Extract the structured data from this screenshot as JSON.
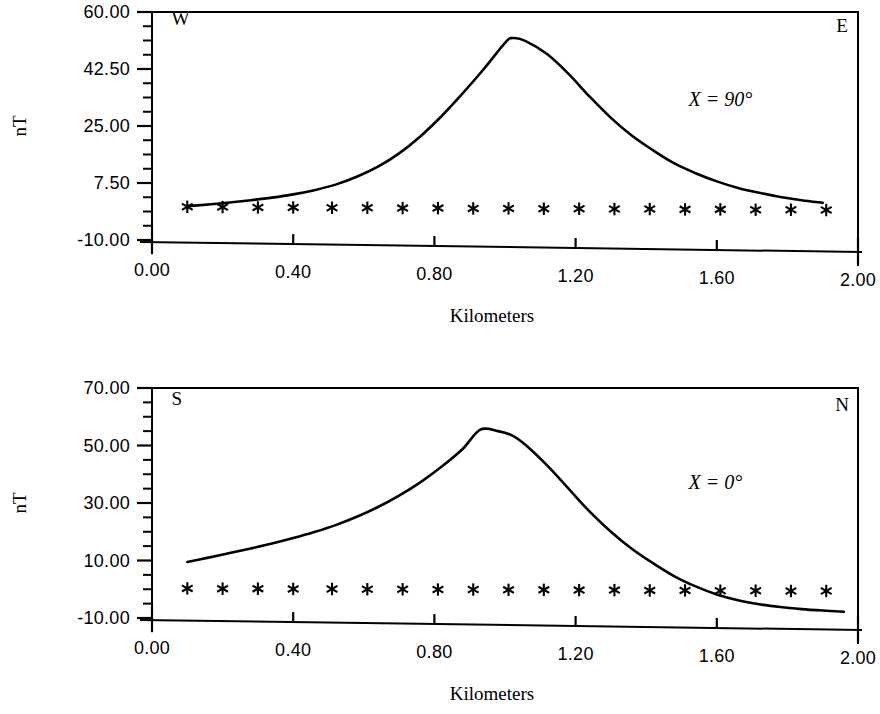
{
  "figure": {
    "background": "#ffffff",
    "ink_color": "#000000"
  },
  "charts": [
    {
      "id": "chart-top",
      "ylabel": "nT",
      "xlabel": "Kilometers",
      "corner_left": "W",
      "corner_right": "E",
      "annotation": "X = 90°",
      "ytick_labels": [
        "60.00",
        "42.50",
        "25.00",
        "7.50",
        "-10.00"
      ],
      "xtick_labels": [
        "0.00",
        "0.40",
        "0.80",
        "1.20",
        "1.60",
        "2.00"
      ]
    },
    {
      "id": "chart-bottom",
      "ylabel": "nT",
      "xlabel": "Kilometers",
      "corner_left": "S",
      "corner_right": "N",
      "annotation": "X = 0°",
      "ytick_labels": [
        "70.00",
        "50.00",
        "30.00",
        "10.00",
        "-10.00"
      ],
      "xtick_labels": [
        "0.00",
        "0.40",
        "0.80",
        "1.20",
        "1.60",
        "2.00"
      ]
    }
  ],
  "chart_data": [
    {
      "type": "line",
      "id": "chart-top",
      "title": "",
      "xlabel": "Kilometers",
      "ylabel": "nT",
      "xlim": [
        0.0,
        2.0
      ],
      "ylim": [
        -10.0,
        60.0
      ],
      "xticks": [
        0.0,
        0.4,
        0.8,
        1.2,
        1.6,
        2.0
      ],
      "yticks": [
        -10.0,
        7.5,
        25.0,
        42.5,
        60.0
      ],
      "minor_ticks_per_interval": 3,
      "grid": false,
      "legend": null,
      "annotations": [
        {
          "text": "W",
          "x": 0.06,
          "y": 56.0
        },
        {
          "text": "E",
          "x": 1.94,
          "y": 54.0
        },
        {
          "text": "X = 90°",
          "x": 1.56,
          "y": 31.0
        }
      ],
      "series": [
        {
          "name": "magnetic anomaly profile",
          "style": "solid-line",
          "x": [
            0.1,
            0.16,
            0.22,
            0.28,
            0.34,
            0.4,
            0.46,
            0.52,
            0.58,
            0.64,
            0.7,
            0.76,
            0.82,
            0.88,
            0.94,
            1.0,
            1.02,
            1.06,
            1.12,
            1.18,
            1.24,
            1.3,
            1.36,
            1.42,
            1.48,
            1.54,
            1.6,
            1.66,
            1.72,
            1.78,
            1.84,
            1.9
          ],
          "y": [
            0.4,
            0.9,
            1.5,
            2.2,
            3.0,
            4.0,
            5.3,
            7.0,
            9.4,
            12.5,
            16.6,
            21.8,
            28.0,
            35.0,
            42.5,
            50.5,
            52.0,
            51.0,
            47.0,
            41.0,
            34.0,
            27.5,
            22.0,
            17.5,
            13.5,
            10.5,
            8.0,
            6.0,
            4.5,
            3.2,
            2.2,
            1.4
          ]
        },
        {
          "name": "observation markers",
          "style": "asterisk-markers",
          "x": [
            0.1,
            0.2,
            0.3,
            0.4,
            0.51,
            0.61,
            0.71,
            0.81,
            0.91,
            1.01,
            1.11,
            1.21,
            1.31,
            1.41,
            1.51,
            1.61,
            1.71,
            1.81,
            1.91
          ],
          "y": [
            0.2,
            0.1,
            0.0,
            0.0,
            -0.1,
            -0.1,
            -0.2,
            -0.2,
            -0.3,
            -0.3,
            -0.4,
            -0.4,
            -0.5,
            -0.5,
            -0.6,
            -0.6,
            -0.7,
            -0.7,
            -0.8
          ]
        }
      ]
    },
    {
      "type": "line",
      "id": "chart-bottom",
      "title": "",
      "xlabel": "Kilometers",
      "ylabel": "nT",
      "xlim": [
        0.0,
        2.0
      ],
      "ylim": [
        -10.0,
        70.0
      ],
      "xticks": [
        0.0,
        0.4,
        0.8,
        1.2,
        1.6,
        2.0
      ],
      "yticks": [
        -10.0,
        10.0,
        30.0,
        50.0,
        70.0
      ],
      "minor_ticks_per_interval": 3,
      "grid": false,
      "legend": null,
      "annotations": [
        {
          "text": "S",
          "x": 0.06,
          "y": 64.0
        },
        {
          "text": "N",
          "x": 1.94,
          "y": 62.0
        },
        {
          "text": "X = 0°",
          "x": 1.56,
          "y": 35.0
        }
      ],
      "series": [
        {
          "name": "magnetic anomaly profile",
          "style": "solid-line",
          "x": [
            0.1,
            0.16,
            0.22,
            0.28,
            0.34,
            0.4,
            0.46,
            0.52,
            0.58,
            0.64,
            0.7,
            0.76,
            0.82,
            0.88,
            0.93,
            0.98,
            1.02,
            1.06,
            1.12,
            1.18,
            1.24,
            1.3,
            1.36,
            1.42,
            1.48,
            1.54,
            1.6,
            1.66,
            1.72,
            1.78,
            1.84,
            1.9,
            1.96
          ],
          "y": [
            9.5,
            11.0,
            12.6,
            14.2,
            15.9,
            17.8,
            19.9,
            22.3,
            25.2,
            28.6,
            32.6,
            37.2,
            42.6,
            48.8,
            55.5,
            55.0,
            53.5,
            50.0,
            43.0,
            35.0,
            27.0,
            20.0,
            14.0,
            9.0,
            4.5,
            1.0,
            -1.8,
            -3.8,
            -5.2,
            -6.2,
            -6.9,
            -7.4,
            -7.8
          ]
        },
        {
          "name": "observation markers",
          "style": "asterisk-markers",
          "x": [
            0.1,
            0.2,
            0.3,
            0.4,
            0.51,
            0.61,
            0.71,
            0.81,
            0.91,
            1.01,
            1.11,
            1.21,
            1.31,
            1.41,
            1.51,
            1.61,
            1.71,
            1.81,
            1.91
          ],
          "y": [
            0.3,
            0.2,
            0.2,
            0.1,
            0.1,
            0.0,
            0.0,
            -0.1,
            -0.1,
            -0.2,
            -0.2,
            -0.3,
            -0.3,
            -0.4,
            -0.4,
            -0.5,
            -0.5,
            -0.6,
            -0.6
          ]
        }
      ]
    }
  ]
}
